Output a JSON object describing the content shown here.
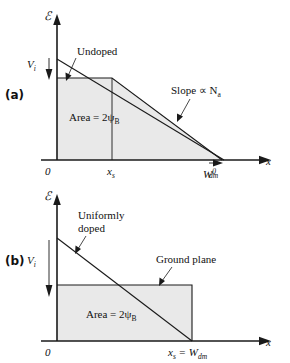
{
  "figure": {
    "type": "diagram",
    "description_title": "Electric field distribution in MOSFET depletion region",
    "colors": {
      "line": "#1a1a1a",
      "shade": "#e9e9e9",
      "background": "#ffffff"
    },
    "panels": [
      {
        "id": "a",
        "label": "(a)",
        "y_axis_label": "ℰ",
        "x_axis_label": "x",
        "voltage_label": "V",
        "voltage_sub": "i",
        "annotations": [
          {
            "name": "undoped",
            "text": "Undoped"
          },
          {
            "name": "slope",
            "text": "Slope ∝ N",
            "sub": "a"
          },
          {
            "name": "area",
            "text": "Area = 2ψ",
            "sub": "B"
          }
        ],
        "x_ticks": [
          {
            "name": "origin",
            "text": "0"
          },
          {
            "name": "x-s",
            "text": "x",
            "sub": "s"
          },
          {
            "name": "w-dm-0",
            "text": "W",
            "sub": "dm",
            "sup": "0"
          }
        ]
      },
      {
        "id": "b",
        "label": "(b)",
        "y_axis_label": "ℰ",
        "x_axis_label": "x",
        "voltage_label": "V",
        "voltage_sub": "i",
        "annotations": [
          {
            "name": "uniformly-doped-line1",
            "text": "Uniformly"
          },
          {
            "name": "uniformly-doped-line2",
            "text": "doped"
          },
          {
            "name": "ground-plane",
            "text": "Ground  plane"
          },
          {
            "name": "area",
            "text": "Area = 2ψ",
            "sub": "B"
          }
        ],
        "x_ticks": [
          {
            "name": "origin",
            "text": "0"
          },
          {
            "name": "xs-equals-wdm",
            "text": "x",
            "sub": "s",
            "mid": " = W",
            "sub2": "dm"
          }
        ]
      }
    ]
  }
}
